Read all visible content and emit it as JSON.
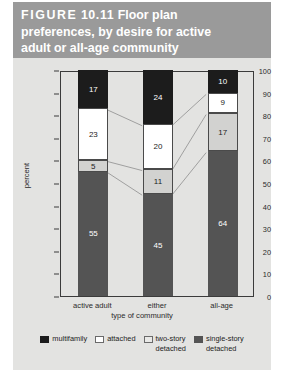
{
  "figure": {
    "label_word": "FIGURE",
    "label_number": "10.11",
    "title_line1_rest": " Floor plan",
    "title_line2": "preferences, by desire for active",
    "title_line3": "adult or all-age community",
    "band_color": "#9a9a9a",
    "panel_color": "#e3e3e1"
  },
  "chart_data": {
    "type": "bar",
    "subtype": "stacked-bar-100-percent",
    "title": "FIGURE 10.11 Floor plan preferences, by desire for active adult or all-age community",
    "categories": [
      "active adult",
      "either",
      "all-age"
    ],
    "series": [
      {
        "name": "single-story detached",
        "values": [
          55,
          45,
          64
        ],
        "color": "#545454"
      },
      {
        "name": "two-story detached",
        "values": [
          5,
          11,
          17
        ],
        "color": "#d2d2d0"
      },
      {
        "name": "attached",
        "values": [
          23,
          20,
          9
        ],
        "color": "#ffffff"
      },
      {
        "name": "multifamily",
        "values": [
          17,
          24,
          10
        ],
        "color": "#1c1c1c"
      }
    ],
    "xlabel": "type of community",
    "ylabel": "percent",
    "ylim": [
      0,
      100
    ],
    "yticks": [
      0,
      10,
      20,
      30,
      40,
      50,
      60,
      70,
      80,
      90,
      100
    ],
    "grid": false,
    "legend_position": "bottom",
    "connectors": true
  },
  "legend": {
    "items": [
      {
        "label": "multifamily",
        "swatch": "multifamily"
      },
      {
        "label": "attached",
        "swatch": "attached"
      },
      {
        "label": "two-story\ndetached",
        "swatch": "twostory"
      },
      {
        "label": "single-story\ndetached",
        "swatch": "singlestory"
      }
    ]
  }
}
